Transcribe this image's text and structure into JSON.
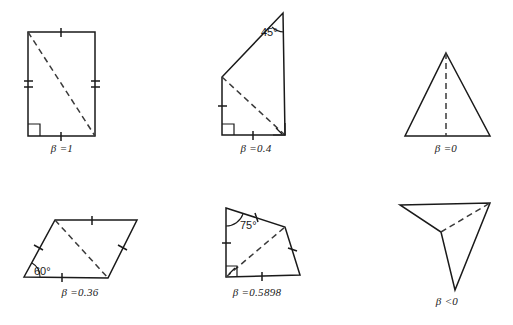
{
  "figure": {
    "background_color": "#ffffff",
    "stroke_color": "#1a1a1a",
    "dash_color": "#3a3a3a",
    "title": ""
  },
  "panels": [
    {
      "id": "panel-beta-1",
      "shape_name": "rectangle",
      "label_symbol": "β",
      "label_relation": "=",
      "label_value": "1",
      "label_text": "β =1",
      "label_x": 62,
      "label_y": 148,
      "angle_annotations": [],
      "right_angle_marks": 1,
      "tick_marks": 4,
      "vertices": [
        [
          28,
          32
        ],
        [
          95,
          32
        ],
        [
          95,
          136
        ],
        [
          28,
          136
        ]
      ],
      "diagonal": [
        [
          28,
          32
        ],
        [
          95,
          136
        ]
      ]
    },
    {
      "id": "panel-beta-0-4",
      "shape_name": "right-trapezoid",
      "label_symbol": "β",
      "label_relation": "=",
      "label_value": "0.4",
      "label_text": "β =0.4",
      "label_x": 256,
      "label_y": 148,
      "angle_annotations": [
        {
          "text": "45°",
          "x": 261,
          "y": 32
        }
      ],
      "right_angle_marks": 2,
      "tick_marks": 2,
      "vertices": [
        [
          283,
          13
        ],
        [
          285,
          135
        ],
        [
          222,
          135
        ],
        [
          222,
          77
        ]
      ],
      "diagonal": [
        [
          222,
          77
        ],
        [
          285,
          135
        ]
      ]
    },
    {
      "id": "panel-beta-0",
      "shape_name": "isosceles-triangle",
      "label_symbol": "β",
      "label_relation": "=",
      "label_value": "0",
      "label_text": "β =0",
      "label_x": 446,
      "label_y": 148,
      "angle_annotations": [],
      "right_angle_marks": 0,
      "tick_marks": 0,
      "vertices": [
        [
          446,
          53
        ],
        [
          490,
          136
        ],
        [
          405,
          136
        ]
      ],
      "diagonal": [
        [
          446,
          53
        ],
        [
          446,
          136
        ]
      ]
    },
    {
      "id": "panel-beta-0-36",
      "shape_name": "parallelogram",
      "label_symbol": "β",
      "label_relation": "=",
      "label_value": "0.36",
      "label_text": "β =0.36",
      "label_x": 80,
      "label_y": 291,
      "angle_annotations": [
        {
          "text": "60°",
          "x": 28,
          "y": 274
        }
      ],
      "right_angle_marks": 0,
      "tick_marks": 4,
      "vertices": [
        [
          24,
          277
        ],
        [
          55,
          220
        ],
        [
          137,
          220
        ],
        [
          108,
          278
        ]
      ],
      "diagonal": [
        [
          55,
          220
        ],
        [
          108,
          278
        ]
      ]
    },
    {
      "id": "panel-beta-0-5898",
      "shape_name": "irregular-quadrilateral",
      "label_symbol": "β",
      "label_relation": "=",
      "label_value": "0.5898",
      "label_text": "β =0.5898",
      "label_x": 257,
      "label_y": 291,
      "angle_annotations": [
        {
          "text": "75°",
          "x": 243,
          "y": 224
        }
      ],
      "right_angle_marks": 1,
      "tick_marks": 4,
      "vertices": [
        [
          226,
          208
        ],
        [
          285,
          227
        ],
        [
          300,
          275
        ],
        [
          226,
          277
        ]
      ],
      "diagonal": [
        [
          226,
          277
        ],
        [
          285,
          227
        ]
      ]
    },
    {
      "id": "panel-beta-negative",
      "shape_name": "concave-quadrilateral",
      "label_symbol": "β",
      "label_relation": "<",
      "label_value": "0",
      "label_text": "β <0",
      "label_x": 447,
      "label_y": 297,
      "angle_annotations": [],
      "right_angle_marks": 0,
      "tick_marks": 0,
      "vertices": [
        [
          400,
          205
        ],
        [
          490,
          203
        ],
        [
          455,
          290
        ],
        [
          441,
          232
        ]
      ],
      "diagonal": [
        [
          441,
          232
        ],
        [
          490,
          203
        ]
      ]
    }
  ]
}
